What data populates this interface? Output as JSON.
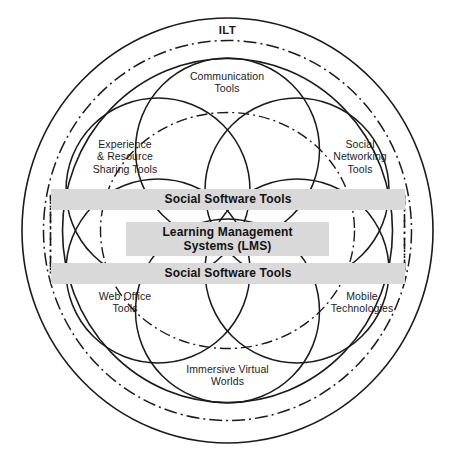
{
  "diagram": {
    "title": "ILT",
    "outer_ring_label": "ILT",
    "bands": [
      {
        "id": "sst-top",
        "label": "Social Software Tools"
      },
      {
        "id": "lms-center",
        "label": "Learning Management\nSystems (LMS)"
      },
      {
        "id": "sst-bottom",
        "label": "Social Software Tools"
      }
    ],
    "petals": [
      {
        "id": "communication-tools",
        "label": "Communication\nTools"
      },
      {
        "id": "experience-resource-sharing-tools",
        "label": "Experience\n& Resource\nSharing Tools"
      },
      {
        "id": "social-networking-tools",
        "label": "Social\nNetworking\nTools"
      },
      {
        "id": "web-office-tools",
        "label": "Web Office\nTools"
      },
      {
        "id": "mobile-technologies",
        "label": "Mobile\nTechnologies"
      },
      {
        "id": "immersive-virtual-worlds",
        "label": "Immersive Virtual\nWorlds"
      }
    ],
    "colors": {
      "stroke": "#1a1a1a",
      "band_fill": "#d9d9d9",
      "background": "#ffffff",
      "text": "#111111"
    }
  }
}
